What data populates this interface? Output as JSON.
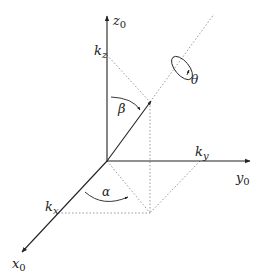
{
  "diagram": {
    "type": "3d-coordinate-frame",
    "colors": {
      "axis": "#222222",
      "dotted": "#999999",
      "background": "#ffffff"
    },
    "axes": {
      "x": {
        "label": "x",
        "subscript": "0"
      },
      "y": {
        "label": "y",
        "subscript": "0"
      },
      "z": {
        "label": "z",
        "subscript": "0"
      }
    },
    "components": {
      "kx": {
        "label": "k",
        "subscript": "x"
      },
      "ky": {
        "label": "k",
        "subscript": "y"
      },
      "kz": {
        "label": "k",
        "subscript": "z"
      }
    },
    "angles": {
      "alpha": "α",
      "beta": "β",
      "theta": "θ"
    }
  }
}
